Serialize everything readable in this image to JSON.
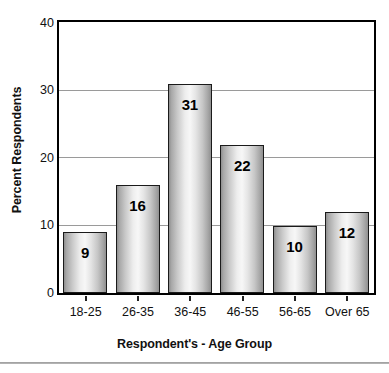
{
  "chart_data": {
    "type": "bar",
    "title": "",
    "xlabel": "Respondent's - Age Group",
    "ylabel": "Percent Respondents",
    "categories": [
      "18-25",
      "26-35",
      "36-45",
      "46-55",
      "56-65",
      "Over 65"
    ],
    "values": [
      9,
      16,
      31,
      22,
      10,
      12
    ],
    "data_labels": [
      "9",
      "16",
      "31",
      "22",
      "10",
      "12"
    ],
    "ylim": [
      0,
      40
    ],
    "y_ticks": [
      0,
      10,
      20,
      30,
      40
    ],
    "y_tick_labels": [
      "0",
      "10",
      "20",
      "30",
      "40"
    ],
    "grid": "horizontal",
    "legend": "none",
    "colors": {
      "bar_fill_light": "#f7f7f7",
      "bar_fill_dark": "#8f8f8f",
      "bar_border": "#1a1a1a",
      "gridline": "#9a9a9a",
      "axis": "#000000",
      "text": "#111111",
      "background": "#ffffff"
    }
  },
  "axes": {
    "y_title": "Percent Respondents",
    "x_title": "Respondent's - Age Group"
  }
}
